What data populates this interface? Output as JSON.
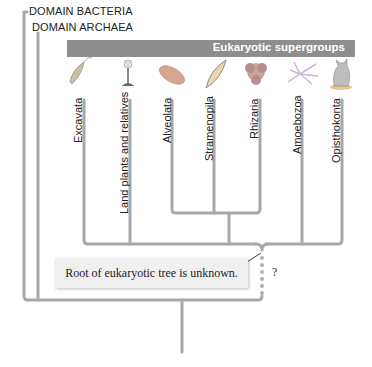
{
  "domains": [
    {
      "label": "DOMAIN BACTERIA"
    },
    {
      "label": "DOMAIN ARCHAEA"
    }
  ],
  "banner": {
    "title": "Eukaryotic supergroups"
  },
  "supergroups": [
    {
      "label": "Excavata",
      "icon": "flagellate-icon"
    },
    {
      "label": "Land plants and relatives",
      "icon": "plant-icon"
    },
    {
      "label": "Alveolata",
      "icon": "paramecium-icon"
    },
    {
      "label": "Stramenopila",
      "icon": "diatom-icon"
    },
    {
      "label": "Rhizaria",
      "icon": "foraminifera-icon"
    },
    {
      "label": "Amoebozoa",
      "icon": "amoeba-icon"
    },
    {
      "label": "Opisthokonta",
      "icon": "cat-icon"
    }
  ],
  "annotation": {
    "text": "Root of eukaryotic tree is unknown.",
    "question_mark": "?"
  },
  "colors": {
    "branch": "#a6a6a6",
    "banner": "#8e8e8e",
    "box": "#f0f0f0"
  }
}
